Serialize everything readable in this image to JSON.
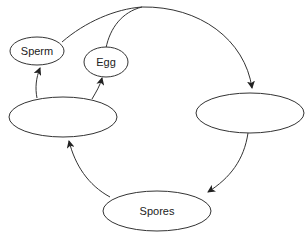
{
  "diagram": {
    "title": "",
    "nodes": [
      {
        "id": "sperm",
        "label": "Sperm"
      },
      {
        "id": "egg",
        "label": "Egg"
      },
      {
        "id": "left-stage",
        "label": ""
      },
      {
        "id": "right-stage",
        "label": ""
      },
      {
        "id": "spores",
        "label": "Spores"
      }
    ],
    "edges": [
      {
        "from": "left-stage",
        "to": "sperm"
      },
      {
        "from": "left-stage",
        "to": "egg"
      },
      {
        "from": "sperm",
        "to": "right-stage"
      },
      {
        "from": "egg",
        "to": "right-stage"
      },
      {
        "from": "right-stage",
        "to": "spores"
      },
      {
        "from": "spores",
        "to": "left-stage"
      }
    ],
    "colors": {
      "stroke": "#333333",
      "fill": "#ffffff",
      "text": "#222222"
    }
  }
}
